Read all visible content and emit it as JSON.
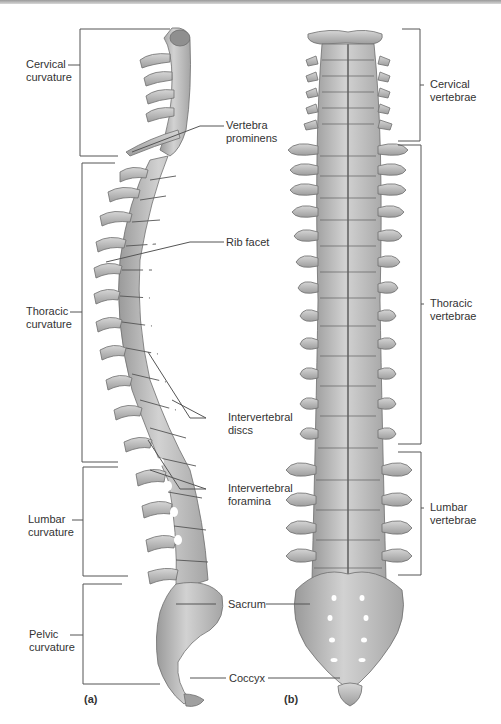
{
  "figure": {
    "panel_a": "(a)",
    "panel_b": "(b)",
    "colors": {
      "bone": "#b9b9b9",
      "bone_dark": "#8c8c8c",
      "bone_light": "#dcdcdc",
      "line": "#555555",
      "text": "#333333"
    }
  },
  "left_labels": {
    "cervical": [
      "Cervical",
      "curvature"
    ],
    "thoracic": [
      "Thoracic",
      "curvature"
    ],
    "lumbar": [
      "Lumbar",
      "curvature"
    ],
    "pelvic": [
      "Pelvic",
      "curvature"
    ]
  },
  "middle_labels": {
    "vertebra_prominens": [
      "Vertebra",
      "prominens"
    ],
    "rib_facet": "Rib facet",
    "intervertebral_discs": [
      "Intervertebral",
      "discs"
    ],
    "intervertebral_foramina": [
      "Intervertebral",
      "foramina"
    ],
    "sacrum": "Sacrum",
    "coccyx": "Coccyx"
  },
  "right_labels": {
    "cervical": [
      "Cervical",
      "vertebrae"
    ],
    "thoracic": [
      "Thoracic",
      "vertebrae"
    ],
    "lumbar": [
      "Lumbar",
      "vertebrae"
    ]
  }
}
